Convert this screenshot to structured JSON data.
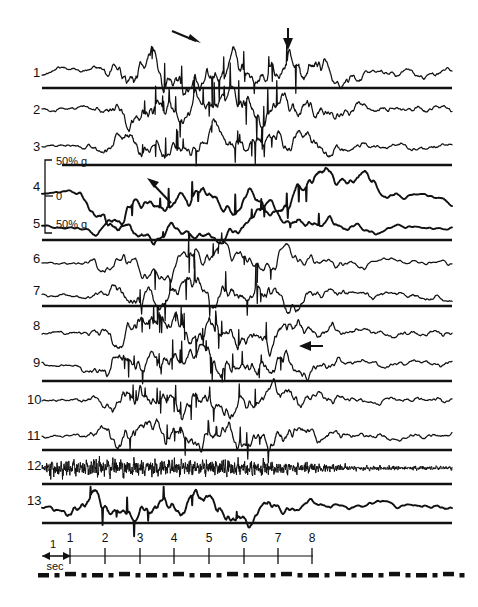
{
  "figure": {
    "type": "multichannel-polygraph-recording",
    "width": 478,
    "height": 607,
    "background": "#ffffff",
    "ink_color": "#111111"
  },
  "channels": {
    "labels": [
      "1",
      "2",
      "3",
      "4",
      "5",
      "6",
      "7",
      "8",
      "9",
      "10",
      "11",
      "12",
      "13"
    ],
    "count": 13
  },
  "scale_bar": {
    "top_label": "50% g",
    "mid_label": "0",
    "bottom_label": "50% g",
    "applies_to_channel": "4"
  },
  "time_axis": {
    "unit_label_top": "1",
    "unit_label_bottom": "sec",
    "tick_labels": [
      "1",
      "2",
      "3",
      "4",
      "5",
      "6",
      "7",
      "8"
    ],
    "tick_count": 8
  },
  "annotations": {
    "arrow_1_label": "arrow-channel-1-diagonal",
    "arrow_2_label": "arrow-channel-1-down",
    "arrow_3_label": "arrow-channel-4-up-left",
    "arrow_4_label": "arrow-channel-9-left"
  },
  "chart_data": {
    "type": "line",
    "title": "",
    "xlabel": "sec",
    "ylabel": "",
    "xlim": [
      0,
      9.2
    ],
    "grid": false,
    "legend": "none",
    "axis_ticks_x": [
      1,
      2,
      3,
      4,
      5,
      6,
      7,
      8
    ],
    "scale_reference": {
      "positive": "50% g",
      "zero": "0",
      "negative": "50% g"
    },
    "series": [
      {
        "name": "1",
        "trace_style": "thin",
        "amplitude": "large",
        "burst_window_sec": [
          1.6,
          5.2
        ]
      },
      {
        "name": "2",
        "trace_style": "thin",
        "amplitude": "large",
        "burst_window_sec": [
          1.6,
          5.2
        ]
      },
      {
        "name": "3",
        "trace_style": "thin",
        "amplitude": "medium",
        "burst_window_sec": [
          1.6,
          5.2
        ]
      },
      {
        "name": "4",
        "trace_style": "thick",
        "amplitude": "slow-large",
        "burst_window_sec": [
          1.4,
          6.0
        ]
      },
      {
        "name": "5",
        "trace_style": "thick",
        "amplitude": "slow-medium",
        "burst_window_sec": [
          1.4,
          6.0
        ]
      },
      {
        "name": "6",
        "trace_style": "thin",
        "amplitude": "medium",
        "burst_window_sec": [
          1.4,
          5.5
        ]
      },
      {
        "name": "7",
        "trace_style": "thin",
        "amplitude": "medium",
        "burst_window_sec": [
          1.4,
          5.0
        ]
      },
      {
        "name": "8",
        "trace_style": "thin",
        "amplitude": "medium",
        "burst_window_sec": [
          1.4,
          5.0
        ]
      },
      {
        "name": "9",
        "trace_style": "thin",
        "amplitude": "medium",
        "burst_window_sec": [
          1.4,
          5.5
        ]
      },
      {
        "name": "10",
        "trace_style": "thin",
        "amplitude": "medium",
        "burst_window_sec": [
          1.4,
          5.0
        ]
      },
      {
        "name": "11",
        "trace_style": "thin",
        "amplitude": "medium",
        "burst_window_sec": [
          1.4,
          5.0
        ]
      },
      {
        "name": "12",
        "trace_style": "fine",
        "amplitude": "small-highfreq",
        "burst_window_sec": [
          0.2,
          4.5
        ]
      },
      {
        "name": "13",
        "trace_style": "thick",
        "amplitude": "medium-slow",
        "burst_window_sec": [
          1.0,
          4.5
        ]
      }
    ]
  }
}
